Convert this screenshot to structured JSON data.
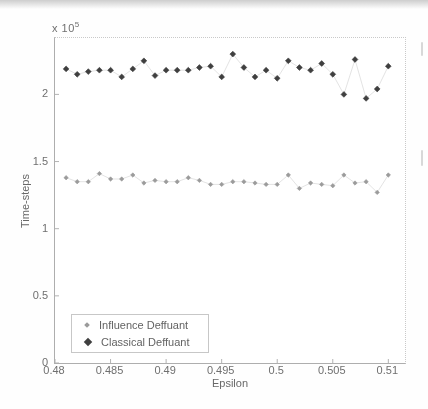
{
  "chart_data": {
    "type": "scatter",
    "title": "",
    "xlabel": "Epsilon",
    "ylabel": "Time-steps",
    "y_multiplier_base": "x 10",
    "y_multiplier_exp": "5",
    "y_unit_note": "time-steps values are in units of 1e5",
    "xlim": [
      0.48,
      0.5115
    ],
    "ylim": [
      0,
      2.42
    ],
    "grid": false,
    "legend_position": "inside-bottom-left",
    "connector_color": "#dcdcdc",
    "x": [
      0.481,
      0.482,
      0.483,
      0.484,
      0.485,
      0.486,
      0.487,
      0.488,
      0.489,
      0.49,
      0.491,
      0.492,
      0.493,
      0.494,
      0.495,
      0.496,
      0.497,
      0.498,
      0.499,
      0.5,
      0.501,
      0.502,
      0.503,
      0.504,
      0.505,
      0.506,
      0.507,
      0.508,
      0.509,
      0.51
    ],
    "series": [
      {
        "name": "Influence Deffuant",
        "color": "#9b9b9b",
        "marker": "diamond",
        "marker_half_size": 2.2,
        "values_x1e5": [
          1.38,
          1.35,
          1.35,
          1.41,
          1.37,
          1.37,
          1.4,
          1.34,
          1.36,
          1.35,
          1.35,
          1.38,
          1.36,
          1.33,
          1.33,
          1.35,
          1.35,
          1.34,
          1.33,
          1.33,
          1.4,
          1.3,
          1.34,
          1.33,
          1.32,
          1.4,
          1.34,
          1.35,
          1.27,
          1.4
        ]
      },
      {
        "name": "Classical Deffuant",
        "color": "#3f3f3f",
        "marker": "diamond",
        "marker_half_size": 2.9,
        "values_x1e5": [
          2.19,
          2.15,
          2.17,
          2.18,
          2.18,
          2.13,
          2.19,
          2.25,
          2.14,
          2.18,
          2.18,
          2.18,
          2.2,
          2.21,
          2.13,
          2.3,
          2.2,
          2.13,
          2.18,
          2.12,
          2.25,
          2.2,
          2.18,
          2.23,
          2.15,
          2.0,
          2.26,
          1.97,
          2.04,
          2.21
        ]
      }
    ],
    "x_ticks": {
      "values": [
        0.48,
        0.485,
        0.49,
        0.495,
        0.5,
        0.505,
        0.51
      ],
      "labels": [
        "0.48",
        "0.485",
        "0.49",
        "0.495",
        "0.5",
        "0.505",
        "0.51"
      ]
    },
    "y_ticks": {
      "values": [
        0,
        0.5,
        1,
        1.5,
        2
      ],
      "labels": [
        "0",
        "0.5",
        "1",
        "1.5",
        "2"
      ]
    }
  }
}
